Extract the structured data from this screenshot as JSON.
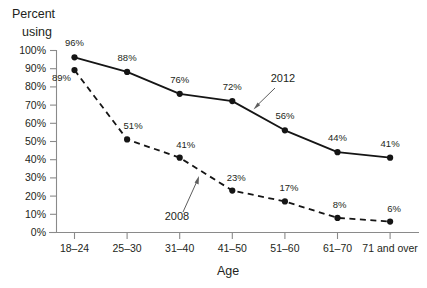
{
  "chart_data": {
    "type": "line",
    "title": "",
    "ylabel_line1": "Percent",
    "ylabel_line2": "using",
    "xlabel": "Age",
    "categories": [
      "18–24",
      "25–30",
      "31–40",
      "41–50",
      "51–60",
      "61–70",
      "71 and over"
    ],
    "ylim": [
      0,
      100
    ],
    "ytick_labels": [
      "0%",
      "10%",
      "20%",
      "30%",
      "40%",
      "50%",
      "60%",
      "70%",
      "80%",
      "90%",
      "100%"
    ],
    "ytick_values": [
      0,
      10,
      20,
      30,
      40,
      50,
      60,
      70,
      80,
      90,
      100
    ],
    "grid": false,
    "legend_position": "inline-annotation",
    "series": [
      {
        "name": "2012",
        "style": "solid",
        "values": [
          96,
          88,
          76,
          72,
          56,
          44,
          41
        ],
        "value_labels": [
          "96%",
          "88%",
          "76%",
          "72%",
          "56%",
          "44%",
          "41%"
        ]
      },
      {
        "name": "2008",
        "style": "dashed",
        "values": [
          89,
          51,
          41,
          23,
          17,
          8,
          6
        ],
        "value_labels": [
          "89%",
          "51%",
          "41%",
          "23%",
          "17%",
          "8%",
          "6%"
        ]
      }
    ],
    "annotations": [
      {
        "text": "2012",
        "series": "2012"
      },
      {
        "text": "2008",
        "series": "2008"
      }
    ]
  },
  "colors": {
    "line": "#151515",
    "axis": "#8a8a8a",
    "text": "#231f20",
    "annotation_arrow": "#5d5d5d",
    "background": "#ffffff"
  }
}
